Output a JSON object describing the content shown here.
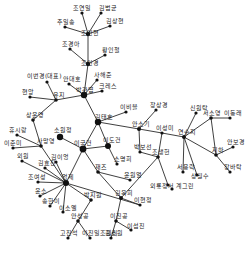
{
  "diagram": {
    "type": "network",
    "background": "#ffffff",
    "node_color": "#111111",
    "edge_color": "#2a2a2a",
    "nodes": [
      {
        "id": "n1",
        "label": "조연일",
        "x": 82,
        "y": 13,
        "r": 1.6,
        "lx": -9,
        "ly": -3
      },
      {
        "id": "n2",
        "label": "김범균",
        "x": 101,
        "y": 13,
        "r": 1.6,
        "lx": -2,
        "ly": -3
      },
      {
        "id": "n3",
        "label": "추일송",
        "x": 65,
        "y": 27,
        "r": 1.6,
        "lx": -8,
        "ly": -3
      },
      {
        "id": "n4",
        "label": "김상현",
        "x": 110,
        "y": 26,
        "r": 1.6,
        "lx": -4,
        "ly": -3
      },
      {
        "id": "n5",
        "label": "조인현",
        "x": 88,
        "y": 34,
        "r": 2.2,
        "lx": -7,
        "ly": 1
      },
      {
        "id": "n6",
        "label": "조경아",
        "x": 70,
        "y": 49,
        "r": 1.6,
        "lx": -8,
        "ly": -3
      },
      {
        "id": "n7",
        "label": "황인철",
        "x": 105,
        "y": 55,
        "r": 1.6,
        "lx": -3,
        "ly": -3
      },
      {
        "id": "n8",
        "label": "조인경",
        "x": 88,
        "y": 64,
        "r": 2.2,
        "lx": -7,
        "ly": 1
      },
      {
        "id": "n9",
        "label": "이번경(대표)",
        "x": 47,
        "y": 82,
        "r": 1.6,
        "lx": -20,
        "ly": -4
      },
      {
        "id": "n10",
        "label": "안대호",
        "x": 69,
        "y": 84,
        "r": 1.6,
        "lx": -6,
        "ly": -3
      },
      {
        "id": "n11",
        "label": "사해준",
        "x": 97,
        "y": 80,
        "r": 1.6,
        "lx": -3,
        "ly": -3
      },
      {
        "id": "n12",
        "label": "크레스",
        "x": 102,
        "y": 91,
        "r": 1.6,
        "lx": -3,
        "ly": -3
      },
      {
        "id": "n13",
        "label": "박관엽",
        "x": 84,
        "y": 95,
        "r": 3.2,
        "lx": -8,
        "ly": -3
      },
      {
        "id": "n14",
        "label": "현앙",
        "x": 30,
        "y": 97,
        "r": 1.6,
        "lx": -8,
        "ly": -3
      },
      {
        "id": "n15",
        "label": "유지",
        "x": 56,
        "y": 100,
        "r": 1.8,
        "lx": -3,
        "ly": -3
      },
      {
        "id": "n16",
        "label": "이비블",
        "x": 126,
        "y": 112,
        "r": 1.6,
        "lx": -6,
        "ly": -3
      },
      {
        "id": "n17",
        "label": "상운영",
        "x": 33,
        "y": 120,
        "r": 1.8,
        "lx": -7,
        "ly": -3
      },
      {
        "id": "n18",
        "label": "김태호",
        "x": 98,
        "y": 122,
        "r": 3.2,
        "lx": -3,
        "ly": -3
      },
      {
        "id": "n19",
        "label": "장상경",
        "x": 156,
        "y": 110,
        "r": 1.6,
        "lx": -6,
        "ly": -3
      },
      {
        "id": "n20",
        "label": "신원탁",
        "x": 196,
        "y": 113,
        "r": 1.6,
        "lx": -6,
        "ly": -3
      },
      {
        "id": "n21",
        "label": "서소영",
        "x": 211,
        "y": 118,
        "r": 1.8,
        "lx": -8,
        "ly": -3
      },
      {
        "id": "n22",
        "label": "이동래",
        "x": 230,
        "y": 118,
        "r": 1.6,
        "lx": -6,
        "ly": -3
      },
      {
        "id": "n23",
        "label": "휴시랑",
        "x": 17,
        "y": 135,
        "r": 1.6,
        "lx": -8,
        "ly": -3
      },
      {
        "id": "n24",
        "label": "소원정",
        "x": 60,
        "y": 137,
        "r": 3.2,
        "lx": -6,
        "ly": -5
      },
      {
        "id": "n25",
        "label": "안소기",
        "x": 139,
        "y": 129,
        "r": 2.0,
        "lx": -7,
        "ly": -3
      },
      {
        "id": "n26",
        "label": "이성미",
        "x": 162,
        "y": 133,
        "r": 1.6,
        "lx": -6,
        "ly": -3
      },
      {
        "id": "n27",
        "label": "연수지",
        "x": 184,
        "y": 137,
        "r": 2.0,
        "lx": -6,
        "ly": -3
      },
      {
        "id": "n28",
        "label": "이춘미",
        "x": 13,
        "y": 148,
        "r": 1.6,
        "lx": -9,
        "ly": -3
      },
      {
        "id": "n29",
        "label": "사망영",
        "x": 41,
        "y": 146,
        "r": 1.8,
        "lx": -4,
        "ly": -3
      },
      {
        "id": "n30",
        "label": "이국건",
        "x": 83,
        "y": 149,
        "r": 3.4,
        "lx": -9,
        "ly": -4
      },
      {
        "id": "n31",
        "label": "이도건",
        "x": 108,
        "y": 146,
        "r": 3.0,
        "lx": -5,
        "ly": -4
      },
      {
        "id": "n32",
        "label": "박보선",
        "x": 140,
        "y": 152,
        "r": 1.6,
        "lx": -6,
        "ly": -3
      },
      {
        "id": "n33",
        "label": "조생헌",
        "x": 158,
        "y": 157,
        "r": 1.8,
        "lx": -6,
        "ly": -3
      },
      {
        "id": "n34",
        "label": "지하",
        "x": 216,
        "y": 155,
        "r": 1.8,
        "lx": -4,
        "ly": -3
      },
      {
        "id": "n35",
        "label": "안보경",
        "x": 233,
        "y": 147,
        "r": 1.6,
        "lx": -6,
        "ly": -3
      },
      {
        "id": "n36",
        "label": "외원",
        "x": 22,
        "y": 161,
        "r": 1.6,
        "lx": -5,
        "ly": -3
      },
      {
        "id": "n37",
        "label": "김이엉",
        "x": 56,
        "y": 162,
        "r": 1.6,
        "lx": -5,
        "ly": -3
      },
      {
        "id": "n38",
        "label": "김효진",
        "x": 45,
        "y": 168,
        "r": 1.6,
        "lx": -7,
        "ly": -3
      },
      {
        "id": "n39",
        "label": "소명희",
        "x": 117,
        "y": 164,
        "r": 1.6,
        "lx": -3,
        "ly": -3
      },
      {
        "id": "n40",
        "label": "재즈",
        "x": 98,
        "y": 172,
        "r": 1.8,
        "lx": -3,
        "ly": -3
      },
      {
        "id": "n41",
        "label": "서용락",
        "x": 183,
        "y": 172,
        "r": 1.6,
        "lx": -6,
        "ly": -3
      },
      {
        "id": "n42",
        "label": "상월수",
        "x": 197,
        "y": 175,
        "r": 1.6,
        "lx": -6,
        "ly": 3
      },
      {
        "id": "n43",
        "label": "장바탁",
        "x": 230,
        "y": 172,
        "r": 1.6,
        "lx": -6,
        "ly": -3
      },
      {
        "id": "n44",
        "label": "윤원열",
        "x": 130,
        "y": 180,
        "r": 1.6,
        "lx": -6,
        "ly": -3
      },
      {
        "id": "n45",
        "label": "조여성",
        "x": 38,
        "y": 182,
        "r": 1.6,
        "lx": -10,
        "ly": -3
      },
      {
        "id": "n46",
        "label": "엉제",
        "x": 66,
        "y": 183,
        "r": 3.0,
        "lx": -4,
        "ly": -4
      },
      {
        "id": "n47",
        "label": "외룡정서",
        "x": 168,
        "y": 185,
        "r": 1.6,
        "lx": -18,
        "ly": 3
      },
      {
        "id": "n48",
        "label": "계그린",
        "x": 172,
        "y": 189,
        "r": 1.6,
        "lx": 4,
        "ly": -1
      },
      {
        "id": "n49",
        "label": "윤소",
        "x": 40,
        "y": 196,
        "r": 1.6,
        "lx": -5,
        "ly": -3
      },
      {
        "id": "n50",
        "label": "박지원",
        "x": 91,
        "y": 200,
        "r": 1.8,
        "lx": -7,
        "ly": -3
      },
      {
        "id": "n51",
        "label": "김옥희",
        "x": 121,
        "y": 198,
        "r": 2.0,
        "lx": -6,
        "ly": -3
      },
      {
        "id": "n52",
        "label": "송한이",
        "x": 50,
        "y": 206,
        "r": 1.6,
        "lx": -8,
        "ly": -3
      },
      {
        "id": "n53",
        "label": "이소엘",
        "x": 63,
        "y": 212,
        "r": 1.6,
        "lx": -4,
        "ly": -2
      },
      {
        "id": "n54",
        "label": "이현정",
        "x": 140,
        "y": 205,
        "r": 1.6,
        "lx": -6,
        "ly": -3
      },
      {
        "id": "n55",
        "label": "안성공",
        "x": 78,
        "y": 221,
        "r": 1.8,
        "lx": -7,
        "ly": -3
      },
      {
        "id": "n56",
        "label": "이진공",
        "x": 116,
        "y": 221,
        "r": 1.8,
        "lx": -6,
        "ly": -3
      },
      {
        "id": "n57",
        "label": "이섭진",
        "x": 131,
        "y": 230,
        "r": 1.6,
        "lx": -4,
        "ly": -2
      },
      {
        "id": "n58",
        "label": "고진석",
        "x": 68,
        "y": 238,
        "r": 1.6,
        "lx": -8,
        "ly": -3
      },
      {
        "id": "n59",
        "label": "이진일조원리",
        "x": 90,
        "y": 238,
        "r": 1.6,
        "lx": -8,
        "ly": -3
      },
      {
        "id": "n60",
        "label": "김소원",
        "x": 111,
        "y": 238,
        "r": 1.6,
        "lx": -6,
        "ly": -3
      }
    ],
    "edges": [
      [
        "n1",
        "n5"
      ],
      [
        "n2",
        "n5"
      ],
      [
        "n3",
        "n5"
      ],
      [
        "n4",
        "n5"
      ],
      [
        "n5",
        "n8"
      ],
      [
        "n6",
        "n8"
      ],
      [
        "n7",
        "n8"
      ],
      [
        "n8",
        "n13"
      ],
      [
        "n9",
        "n15"
      ],
      [
        "n10",
        "n13"
      ],
      [
        "n11",
        "n13"
      ],
      [
        "n12",
        "n13"
      ],
      [
        "n14",
        "n15"
      ],
      [
        "n15",
        "n13"
      ],
      [
        "n15",
        "n17"
      ],
      [
        "n13",
        "n18"
      ],
      [
        "n16",
        "n18"
      ],
      [
        "n18",
        "n25"
      ],
      [
        "n19",
        "n25"
      ],
      [
        "n25",
        "n26"
      ],
      [
        "n26",
        "n27"
      ],
      [
        "n25",
        "n32"
      ],
      [
        "n26",
        "n33"
      ],
      [
        "n27",
        "n20"
      ],
      [
        "n27",
        "n21"
      ],
      [
        "n21",
        "n22"
      ],
      [
        "n21",
        "n34"
      ],
      [
        "n27",
        "n34"
      ],
      [
        "n34",
        "n35"
      ],
      [
        "n34",
        "n43"
      ],
      [
        "n27",
        "n41"
      ],
      [
        "n27",
        "n42"
      ],
      [
        "n33",
        "n47"
      ],
      [
        "n33",
        "n51"
      ],
      [
        "n17",
        "n29"
      ],
      [
        "n23",
        "n29"
      ],
      [
        "n28",
        "n29"
      ],
      [
        "n29",
        "n46"
      ],
      [
        "n24",
        "n30"
      ],
      [
        "n18",
        "n30"
      ],
      [
        "n18",
        "n31"
      ],
      [
        "n31",
        "n30"
      ],
      [
        "n30",
        "n40"
      ],
      [
        "n30",
        "n46"
      ],
      [
        "n31",
        "n39"
      ],
      [
        "n40",
        "n44"
      ],
      [
        "n40",
        "n51"
      ],
      [
        "n36",
        "n46"
      ],
      [
        "n37",
        "n46"
      ],
      [
        "n38",
        "n46"
      ],
      [
        "n45",
        "n46"
      ],
      [
        "n49",
        "n46"
      ],
      [
        "n52",
        "n46"
      ],
      [
        "n53",
        "n46"
      ],
      [
        "n46",
        "n50"
      ],
      [
        "n46",
        "n54"
      ],
      [
        "n50",
        "n55"
      ],
      [
        "n55",
        "n58"
      ],
      [
        "n55",
        "n59"
      ],
      [
        "n51",
        "n56"
      ],
      [
        "n56",
        "n60"
      ],
      [
        "n56",
        "n57"
      ],
      [
        "n51",
        "n54"
      ],
      [
        "n32",
        "n33"
      ]
    ]
  }
}
